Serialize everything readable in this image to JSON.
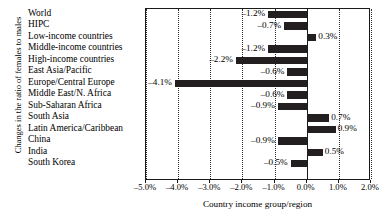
{
  "chart_data": {
    "type": "bar",
    "orientation": "horizontal",
    "title": "",
    "xlabel": "Country income group/region",
    "ylabel": "Changes in the ratio of females to males",
    "unit": "%",
    "xlim": [
      -5.0,
      2.0
    ],
    "xticks": [
      "-5.0%",
      "-4.0%",
      "-3.0%",
      "-2.0%",
      "-1.0%",
      "0.0%",
      "1.0%",
      "2.0%"
    ],
    "xtick_values": [
      -5.0,
      -4.0,
      -3.0,
      -2.0,
      -1.0,
      0.0,
      1.0,
      2.0
    ],
    "grid": "vertical-dotted",
    "legend": "none",
    "bar_color": "#231f20",
    "categories": [
      "World",
      "HIPC",
      "Low-income countries",
      "Middle-income countries",
      "High-income countries",
      "East Asia/Pacific",
      "Europe/Central Europe",
      "Middle East/N. Africa",
      "Sub-Saharan Africa",
      "South Asia",
      "Latin America/Caribbean",
      "China",
      "India",
      "South Korea"
    ],
    "values": [
      -1.2,
      -0.7,
      0.3,
      -1.2,
      -2.2,
      -0.6,
      -4.1,
      -0.6,
      -0.9,
      0.7,
      0.9,
      -0.9,
      0.5,
      -0.5
    ],
    "value_labels": [
      "-1.2%",
      "-0.7%",
      "0.3%",
      "-1.2%",
      "-2.2%",
      "-0.6%",
      "-4.1%",
      "-0.6%",
      "-0.9%",
      "0.7%",
      "0.9%",
      "-0.9%",
      "0.5%",
      "-0.5%"
    ],
    "row_slots": [
      0,
      1,
      2,
      3,
      4,
      5,
      6,
      7,
      8,
      9,
      10,
      11,
      12,
      13
    ],
    "row_count": 15
  }
}
